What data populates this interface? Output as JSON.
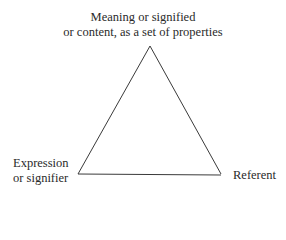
{
  "diagram": {
    "type": "semiotic-triangle",
    "nodes": {
      "top": {
        "lines": [
          "Meaning or signified",
          "or content, as a set of properties"
        ]
      },
      "left": {
        "lines": [
          "Expression",
          "or signifier"
        ]
      },
      "right": {
        "lines": [
          "Referent"
        ]
      }
    },
    "edges": [
      {
        "from": "top",
        "to": "left"
      },
      {
        "from": "top",
        "to": "right"
      },
      {
        "from": "left",
        "to": "right"
      }
    ],
    "colors": {
      "line": "#3a3a3a",
      "text": "#2a2a2a",
      "background": "#ffffff"
    }
  }
}
